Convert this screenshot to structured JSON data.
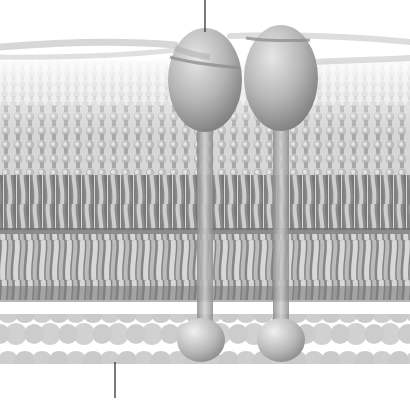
{
  "figure": {
    "type": "illustration",
    "palette": {
      "background": "#ffffff",
      "protein_light": "#d8d8d8",
      "protein_mid": "#a8a8a8",
      "protein_dark": "#7a7a7a",
      "lipid_head": "#bdbdbd",
      "lipid_tail": "#9a9a9a",
      "lipid_tail_dark": "#6e6e6e",
      "fiber": "#c4c4c4",
      "cytoskeleton_bead": "#c9c9c9",
      "leader_line": "#333333"
    },
    "leader_lines": [
      {
        "name": "top-label-pointer",
        "x": 205,
        "y1": 0,
        "y2": 32
      },
      {
        "name": "bottom-label-pointer",
        "x": 115,
        "y1": 362,
        "y2": 398
      }
    ],
    "proteins": [
      {
        "name": "protein-left",
        "cx": 205,
        "cy": 80,
        "rx": 37,
        "ry": 52,
        "stalk_x": 205,
        "ball_cy": 340
      },
      {
        "name": "protein-right",
        "cx": 281,
        "cy": 78,
        "rx": 37,
        "ry": 53,
        "stalk_x": 281,
        "ball_cy": 340
      }
    ]
  }
}
